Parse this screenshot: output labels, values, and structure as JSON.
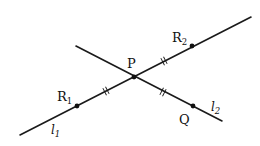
{
  "diagram": {
    "lines": [
      {
        "id": "l1",
        "label": "l",
        "label_sub": "1",
        "through": [
          "R1",
          "P",
          "R2"
        ]
      },
      {
        "id": "l2",
        "label": "l",
        "label_sub": "2",
        "through": [
          "P",
          "Q"
        ]
      }
    ],
    "points": [
      {
        "id": "P",
        "label": "P",
        "label_sub": ""
      },
      {
        "id": "R1",
        "label": "R",
        "label_sub": "1"
      },
      {
        "id": "R2",
        "label": "R",
        "label_sub": "2"
      },
      {
        "id": "Q",
        "label": "Q",
        "label_sub": ""
      }
    ],
    "equal_segments": [
      [
        "R1",
        "P"
      ],
      [
        "P",
        "R2"
      ],
      [
        "P",
        "Q"
      ]
    ],
    "equal_mark": "double-tick"
  }
}
